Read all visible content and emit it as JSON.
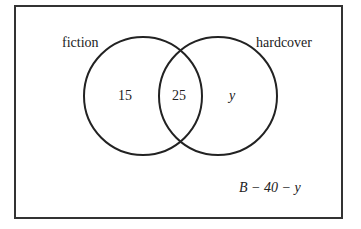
{
  "diagram": {
    "type": "venn",
    "sets": [
      {
        "label": "fiction"
      },
      {
        "label": "hardcover"
      }
    ],
    "regions": {
      "fiction_only": "15",
      "both": "25",
      "hardcover_only": "y",
      "outside": "B − 40 − y"
    },
    "colors": {
      "stroke": "#222222",
      "background": "#ffffff"
    }
  }
}
